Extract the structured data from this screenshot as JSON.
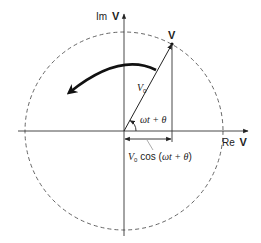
{
  "diagram": {
    "axes": {
      "imag_label": "Im",
      "imag_symbol": "V",
      "real_label": "Re",
      "real_symbol": "V"
    },
    "phasor": {
      "tip_label": "V",
      "magnitude_label": "V",
      "magnitude_subscript": "0",
      "angle_label": "ωt + θ"
    },
    "projection": {
      "label_prefix": "V",
      "label_subscript": "0",
      "label_func": " cos (",
      "label_arg": "ωt + θ",
      "label_close": ")"
    },
    "rotation_direction": "counterclockwise",
    "colors": {
      "line": "#222222",
      "circle": "#555555",
      "background": "#ffffff"
    }
  }
}
